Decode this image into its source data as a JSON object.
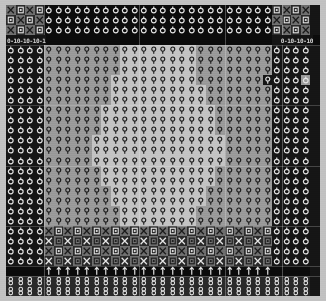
{
  "view": {
    "title": "glyph-matrix",
    "kind": "character-cell-matrix",
    "columns": 33,
    "rows": 29,
    "cell_width_px": 9.5,
    "cell_height_px": 10.0,
    "margin_px": 6
  },
  "palette": {
    "page_background": "#c2c2c2",
    "matrix_background": "#0b0b0b",
    "dark_cell": "#151515",
    "mid_dark_cell": "#2a2a2a",
    "mid_cell": "#6f6f6f",
    "light_cell": "#9a9a9a",
    "lighter_cell": "#b0b0b0",
    "brightest_cell": "#c4c4c4",
    "glyph_light": "#e6e6e6",
    "glyph_dark": "#1a1a1a",
    "rule_color": "#ebebeb"
  },
  "glyph_names": {
    "x": "x-cross-icon",
    "o": "circle-slash-icon",
    "q": "circle-stem-icon",
    "b": "boxed-mini-icon",
    "t": "up-arrow-icon",
    "e": "double-circle-icon",
    "n": "blank-cell"
  },
  "legend": [
    {
      "code": "x",
      "label": "X cross glyph"
    },
    {
      "code": "o",
      "label": "circle with stem glyph"
    },
    {
      "code": "q",
      "label": "circle over stem glyph"
    },
    {
      "code": "b",
      "label": "small boxed glyph"
    },
    {
      "code": "t",
      "label": "vertical arrow glyph"
    },
    {
      "code": "e",
      "label": "stacked double circle glyph"
    },
    {
      "code": "n",
      "label": "empty cell"
    }
  ],
  "text_row": {
    "row_index": 3,
    "left_text": "0-10-10-10-1",
    "right_text": "0-10-10-10"
  },
  "regions": [
    {
      "name": "top-corner-checker",
      "rows": "0-2",
      "cols": "0-3, 29-32"
    },
    {
      "name": "top-circle-band",
      "rows": "0-2",
      "cols": "4-28"
    },
    {
      "name": "scale-text-row",
      "rows": "3",
      "cols": "0-3, 29-32"
    },
    {
      "name": "left-border-column",
      "rows": "4-24",
      "cols": "0-3"
    },
    {
      "name": "right-border-column",
      "rows": "4-24",
      "cols": "29-32"
    },
    {
      "name": "center-body",
      "rows": "4-21",
      "cols": "4-28"
    },
    {
      "name": "lower-x-band",
      "rows": "22-25",
      "cols": "4-28"
    },
    {
      "name": "arrow-row",
      "rows": "26",
      "cols": "0-32"
    },
    {
      "name": "bottom-double-circle-band",
      "rows": "27-28",
      "cols": "0-32"
    }
  ],
  "rules": {
    "vertical_x": [
      4,
      14,
      23,
      29
    ],
    "horizontal_y": [
      4,
      10,
      16,
      22,
      26,
      27
    ]
  },
  "matrix": {
    "rows": [
      {
        "glyphs": "xbxboooooooooooooooooooooooobxbx",
        "shades": "LmLmDDDDDDDDDDDDDDDDDDDDDDDDmLmL"
      },
      {
        "glyphs": "bxbxooooooooooooooooooooooooxbxb",
        "shades": "mLmLDDDDDDDDDDDDDDDDDDDDDDDDLmLm"
      },
      {
        "glyphs": "xbxboooooooooooooooooooooooobxbx",
        "shades": "LmLmDDDDDDDDDDDDDDDDDDDDDDDDmLmL"
      },
      {
        "glyphs": "TTTTnnnnnnnnnnnnnnnnnnnnnnnnTTTT",
        "shades": "ddddDDDDDDDDDDDDDDDDDDDDDDDDdddd"
      },
      {
        "glyphs": "ooooqqqqqqqqqqqqqqqqqqqqqqqqoooo",
        "shades": "ddddiiiiiiiijjjjjjjjiiiiiiiidddd"
      },
      {
        "glyphs": "ooooqqqqqqqqqqqqqqqqqqqqqqqqoooo",
        "shades": "ddddiiiiiiiijjjjjjjjiiiiiiiidddd"
      },
      {
        "glyphs": "ooooqqqqqqqqqqqqqqqqqqqqqqqqoooo",
        "shades": "ddddiiiiiiiijjjjjjjjiiiiiiiidddd"
      },
      {
        "glyphs": "ooooqqqqqqqqqqqqqqqqqqqqqqqqoooo",
        "shades": "ddddiiiiiiijjjjjjjjjiiiiiiidddd d"
      },
      {
        "glyphs": "ooooqqqqqqqqqqqqqqqqqqqqqqqqoooo",
        "shades": "ddddiiiiiiijjjjjjjjjjiiiiiiidddd"
      },
      {
        "glyphs": "ooooqqqqqqqqqqqqqqqqqqqqqqqqoooo",
        "shades": "ddddiiiiiiijjjjjjjjjjiiiiiiidddd"
      },
      {
        "glyphs": "ooooqqqqqqqqqqqqqqqqqqqqqqqqoooo",
        "shades": "ddddiiiiiijjjjjjjjjjjjiiiiiidddd"
      },
      {
        "glyphs": "ooooqqqqqqqqqqqqqqqqqqqqqqqqoooo",
        "shades": "ddddiiiiiijjjjjjjjjjjjiiiiiidddd"
      },
      {
        "glyphs": "ooooqqqqqqqqqqqqqqqqqqqqqqqqoooo",
        "shades": "ddddiiiiiijjjjjjjjjjjjiiiiiidddd"
      },
      {
        "glyphs": "ooooqqqqqqqqqqqqqqqqqqqqqqqqoooo",
        "shades": "ddddiiiiijjjjjjjjjjjjjjiiiiidddd"
      },
      {
        "glyphs": "ooooqqqqqqqqqqqqqqqqqqqqqqqqoooo",
        "shades": "ddddiiiiijjjjjjjjjjjjjjiiiiidddd"
      },
      {
        "glyphs": "ooooqqqqqqqqqqqqqqqqqqqqqqqqoooo",
        "shades": "ddddiiiiijjjjjjjjjjjjjjiiiiidddd"
      },
      {
        "glyphs": "ooooqqqqqqqqqqqqqqqqqqqqqqqqoooo",
        "shades": "ddddiiiiiijjjjjjjjjjjjiiiiiidddd"
      },
      {
        "glyphs": "ooooqqqqqqqqqqqqqqqqqqqqqqqqoooo",
        "shades": "ddddiiiiiijjjjjjjjjjjjiiiiiidddd"
      },
      {
        "glyphs": "ooooqqqqqqqqqqqqqqqqqqqqqqqqoooo",
        "shades": "ddddiiiiiiijjjjjjjjjjiiiiiiidddd"
      },
      {
        "glyphs": "ooooqqqqqqqqqqqqqqqqqqqqqqqqoooo",
        "shades": "ddddiiiiiiijjjjjjjjjjiiiiiiidddd"
      },
      {
        "glyphs": "ooooqqqqqqqqqqqqqqqqqqqqqqqqoooo",
        "shades": "ddddiiiiiiiijjjjjjjjiiiiiiiidddd"
      },
      {
        "glyphs": "ooooqqqqqqqqqqqqqqqqqqqqqqqqoooo",
        "shades": "ddddiiiiiiiijjjjjjjjiiiiiiiidddd"
      },
      {
        "glyphs": "ooooxbxbxbxbxbxbxbxbxbxbxbxboooo",
        "shades": "ddddLmLmLmLmLmLmLmLmLmLmLmLmdddd"
      },
      {
        "glyphs": "ooooxbxbxbxbxbxbxbxbxbxbxbxboooo",
        "shades": "ddddmLmLmLmLmLmLmLmLmLmLmLmLdddd"
      },
      {
        "glyphs": "ooooxbxbxbxbxbxbxbxbxbxbxbxboooo",
        "shades": "ddddLmLmLmLmLmLmLmLmLmLmLmLmdddd"
      },
      {
        "glyphs": "ooooxbxbxbxbxbxbxbxbxbxbxbxboooo",
        "shades": "ddddmLmLmLmLmLmLmLmLmLmLmLmLdddd"
      },
      {
        "glyphs": "nnnnttttttttttttttttttttttttnnnn",
        "shades": "DDDDDDDDDDDDDDDDDDDDDDDDDDDDDDDD"
      },
      {
        "glyphs": "eeeeeeeeeeeeeeeeeeeeeeeeeeeeeeee",
        "shades": "mmmmmmmmmmmmmmmmmmmmmmmmmmmmmmmm"
      },
      {
        "glyphs": "eeeeeeeeeeeeeeeeeeeeeeeeeeeeeeee",
        "shades": "mmmmmmmmmmmmmmmmmmmmmmmmmmmmmmmm"
      }
    ]
  }
}
